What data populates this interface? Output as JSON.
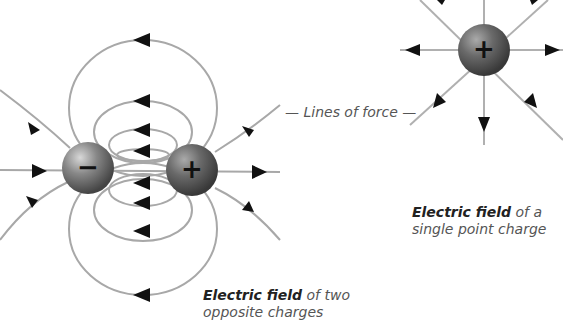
{
  "labels": {
    "lines_of_force": "— Lines of force —",
    "dipole_bold": "Electric field",
    "dipole_rest": " of two",
    "dipole_line2": "opposite charges",
    "single_bold": "Electric field",
    "single_rest": " of a",
    "single_line2": "single point charge"
  },
  "charges": {
    "negative_symbol": "−",
    "positive_symbol": "+",
    "single_symbol": "+"
  },
  "colors": {
    "line": "#a8a8a8",
    "arrow": "#111111",
    "sphere": "#6e6e6e"
  }
}
